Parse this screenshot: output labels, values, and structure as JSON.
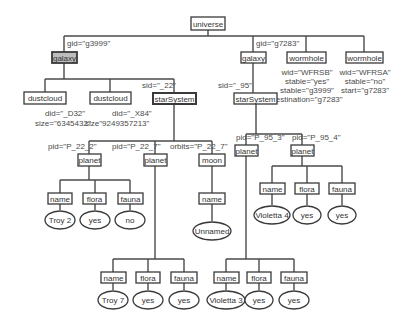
{
  "diagram": {
    "type": "xml-tree",
    "root": "universe",
    "nodes": {
      "universe": "universe",
      "galaxy_left": "galaxy",
      "galaxy_left_attr": "gid=\"g3999\"",
      "galaxy_right": "galaxy",
      "galaxy_right_attr": "gid=\"g7283\"",
      "wormhole_1": "wormhole",
      "wormhole_1_attrs": [
        "wid=\"WFRSB\"",
        "stable=\"yes\"",
        "stable=\"g3999\"",
        "destination=\"g7283\""
      ],
      "wormhole_2": "wormhole",
      "wormhole_2_attrs": [
        "wid=\"WFRSA\"",
        "stable=\"no\"",
        "start=\"g7283\""
      ],
      "dustcloud_1": "dustcloud",
      "dustcloud_1_attrs": [
        "did=\"_D32\"",
        "size=\"6345432\""
      ],
      "dustcloud_2": "dustcloud",
      "dustcloud_2_attrs": [
        "did=\"_X84\"",
        "size\"9249357213\""
      ],
      "starsystem_left": "starSystem",
      "starsystem_left_attr": "sid=\"_22\"",
      "starsystem_right": "starSystem",
      "starsystem_right_attr": "sid=\"_95\"",
      "planet_p22_2": "planet",
      "planet_p22_2_attr": "pid=\"P_22_2\"",
      "planet_p22_7": "planet",
      "planet_p22_7_attr": "pid=\"P_22_7\"",
      "moon": "moon",
      "moon_attr": "orbits=\"P_22_7\"",
      "planet_p95_3": "planet",
      "planet_p95_3_attr": "pid=\"P_95_3\"",
      "planet_p95_4": "planet",
      "planet_p95_4_attr": "pid=\"P_95_4\"",
      "name": "name",
      "flora": "flora",
      "fauna": "fauna"
    },
    "leaf_values": {
      "p22_2": {
        "name": "Troy 2",
        "flora": "yes",
        "fauna": "no"
      },
      "p22_7": {
        "name": "Troy 7",
        "flora": "yes",
        "fauna": "yes"
      },
      "moon": {
        "name": "Unnamed"
      },
      "p95_3": {
        "name": "Violetta 3",
        "flora": "yes",
        "fauna": "yes"
      },
      "p95_4": {
        "name": "Violetta 4",
        "flora": "yes",
        "fauna": "yes"
      }
    }
  }
}
